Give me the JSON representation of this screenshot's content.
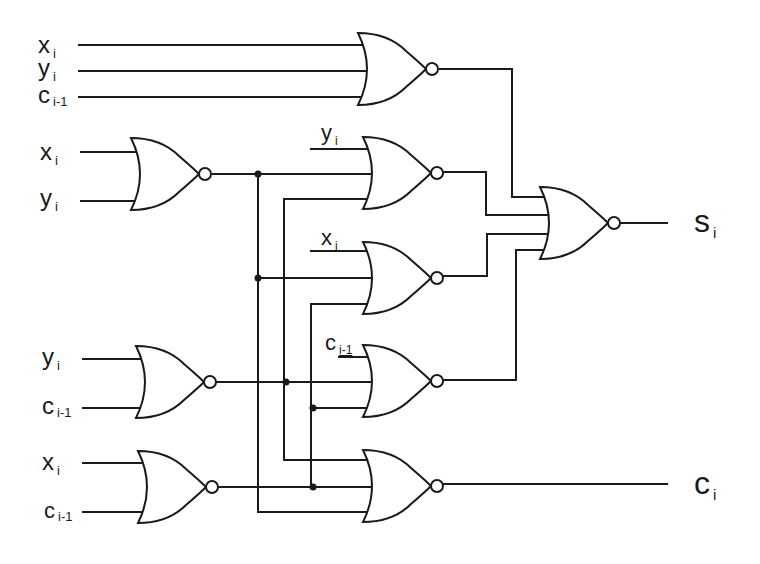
{
  "diagram": {
    "type": "logic-circuit",
    "gate_type": "NOR",
    "colors": {
      "stroke": "#1a1a1a",
      "background": "#ffffff"
    },
    "inputs": {
      "g1": [
        {
          "base": "x",
          "sub": "i"
        },
        {
          "base": "y",
          "sub": "i"
        },
        {
          "base": "c",
          "sub": "i-1"
        }
      ],
      "g2": [
        {
          "base": "x",
          "sub": "i"
        },
        {
          "base": "y",
          "sub": "i"
        }
      ],
      "g3": [
        {
          "base": "y",
          "sub": "i"
        }
      ],
      "g4": [
        {
          "base": "x",
          "sub": "i"
        }
      ],
      "g5": [
        {
          "base": "y",
          "sub": "i"
        },
        {
          "base": "c",
          "sub": "i-1"
        }
      ],
      "g6": [
        {
          "base": "c",
          "sub": "i-1"
        }
      ],
      "g7": [
        {
          "base": "x",
          "sub": "i"
        },
        {
          "base": "c",
          "sub": "i-1"
        }
      ]
    },
    "outputs": {
      "sum": {
        "base": "s",
        "sub": "i"
      },
      "carry": {
        "base": "c",
        "sub": "i"
      }
    },
    "gates": [
      {
        "id": "g1",
        "inputs": [
          "x_i",
          "y_i",
          "c_i-1"
        ],
        "output_to": "g9"
      },
      {
        "id": "g2",
        "inputs": [
          "x_i",
          "y_i"
        ],
        "output_to": [
          "g3",
          "g4",
          "g8"
        ]
      },
      {
        "id": "g3",
        "inputs": [
          "y_i",
          "g2",
          "g5"
        ],
        "output_to": "g9"
      },
      {
        "id": "g4",
        "inputs": [
          "x_i",
          "g2",
          "g7"
        ],
        "output_to": "g9"
      },
      {
        "id": "g5",
        "inputs": [
          "y_i",
          "c_i-1"
        ],
        "output_to": [
          "g3",
          "g6",
          "g8"
        ]
      },
      {
        "id": "g6",
        "inputs": [
          "c_i-1",
          "g5",
          "g7"
        ],
        "output_to": "g9"
      },
      {
        "id": "g7",
        "inputs": [
          "x_i",
          "c_i-1"
        ],
        "output_to": [
          "g4",
          "g6",
          "g8"
        ]
      },
      {
        "id": "g8",
        "inputs": [
          "g5",
          "g7",
          "g2"
        ],
        "output_to": "c_i"
      },
      {
        "id": "g9",
        "inputs": [
          "g1",
          "g3",
          "g4",
          "g6"
        ],
        "output_to": "s_i"
      }
    ]
  }
}
